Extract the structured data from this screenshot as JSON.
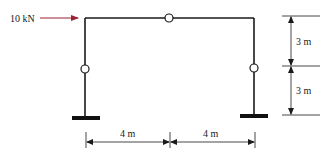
{
  "diagram": {
    "type": "portal-frame",
    "load": {
      "label": "10 kN",
      "direction": "right",
      "color": "#9b2335"
    },
    "horizontal_dimensions": [
      {
        "label": "4 m"
      },
      {
        "label": "4 m"
      }
    ],
    "vertical_dimensions": [
      {
        "label": "3 m"
      },
      {
        "label": "3 m"
      }
    ],
    "hinges": [
      "top-beam-midspan",
      "left-column-midheight",
      "right-column-midheight"
    ],
    "supports": [
      "left-fixed",
      "right-fixed"
    ],
    "colors": {
      "member": "#1a1a1a",
      "load": "#9b2335",
      "dimension": "#1a1a1a"
    }
  }
}
